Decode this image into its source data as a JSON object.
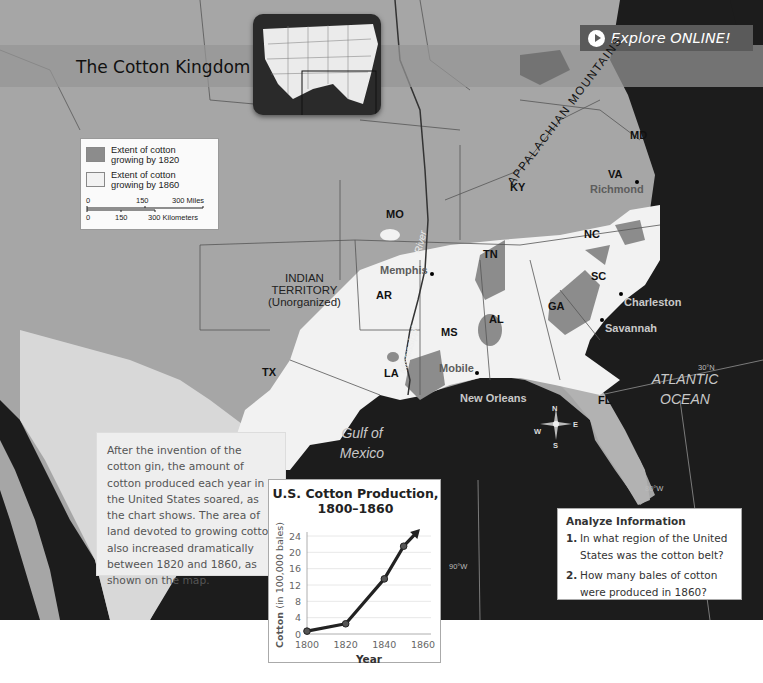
{
  "map": {
    "title": "The Cotton Kingdom",
    "explore_button": {
      "label": "Explore ONLINE!",
      "icon": "play-circle-icon"
    },
    "legend": {
      "items": [
        {
          "label_line1": "Extent of cotton",
          "label_line2": "growing by 1820",
          "color": "#8c8c8c"
        },
        {
          "label_line1": "Extent of cotton",
          "label_line2": "growing by 1860",
          "color": "#f2f2f2"
        }
      ],
      "scale": {
        "miles": [
          "0",
          "150",
          "300 Miles"
        ],
        "kilometers": [
          "0",
          "150",
          "300 Kilometers"
        ]
      }
    },
    "regions": {
      "MO": "MO",
      "KY": "KY",
      "TN": "TN",
      "AR": "AR",
      "MS": "MS",
      "AL": "AL",
      "GA": "GA",
      "SC": "SC",
      "NC": "NC",
      "VA": "VA",
      "MD": "MD",
      "FL": "FL",
      "LA": "LA",
      "TX": "TX",
      "indian_territory_line1": "INDIAN",
      "indian_territory_line2": "TERRITORY",
      "indian_territory_line3": "(Unorganized)"
    },
    "cities": {
      "memphis": "Memphis",
      "richmond": "Richmond",
      "charleston": "Charleston",
      "savannah": "Savannah",
      "mobile": "Mobile",
      "new_orleans": "New Orleans"
    },
    "features": {
      "appalachian": "APPALACHIAN MOUNTAINS",
      "river_part1": "River",
      "river_part2": "Mississippi"
    },
    "water": {
      "gulf_line1": "Gulf of",
      "gulf_line2": "Mexico",
      "atlantic_line1": "ATLANTIC",
      "atlantic_line2": "OCEAN"
    },
    "coordinates": {
      "lat30": "30°N",
      "lon80": "80°W",
      "lon90": "90°W"
    },
    "compass": {
      "n": "N",
      "s": "S",
      "e": "E",
      "w": "W"
    },
    "colors": {
      "cotton_1820": "#8c8c8c",
      "cotton_1860": "#f2f2f2",
      "land": "#a6a6a6",
      "water": "#1c1c1c"
    }
  },
  "caption": {
    "text": "After the invention of the cotton gin, the amount of cotton produced each year in the United States soared, as the chart shows. The area of land devoted to growing cotton also increased dramatically between 1820 and 1860, as shown on the map."
  },
  "analyze": {
    "heading": "Analyze Information",
    "questions": [
      {
        "num": "1.",
        "text": "In what region of the United States was the cotton belt?"
      },
      {
        "num": "2.",
        "text": "How many bales of cotton were produced in 1860?"
      }
    ]
  },
  "chart_data": {
    "type": "line",
    "title": "U.S. Cotton Production, 1800–1860",
    "title_line1": "U.S. Cotton Production,",
    "title_line2": "1800–1860",
    "xlabel": "Year",
    "ylabel_bold": "Cotton",
    "ylabel_rest": "(in 100,000 bales)",
    "x": [
      1800,
      1820,
      1840,
      1850
    ],
    "values": [
      0.7,
      2.5,
      13.5,
      21.5
    ],
    "arrow_continues_to": {
      "x": 1857,
      "y": 25
    },
    "x_ticks": [
      "1800",
      "1820",
      "1840",
      "1860"
    ],
    "y_ticks": [
      "0",
      "4",
      "8",
      "12",
      "16",
      "20",
      "24"
    ],
    "xlim": [
      1800,
      1860
    ],
    "ylim": [
      0,
      24
    ],
    "grid": true,
    "legend": "none"
  }
}
